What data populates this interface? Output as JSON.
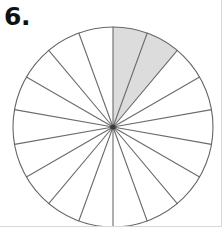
{
  "page": {
    "width": 222,
    "height": 227,
    "background_color": "#ffffff",
    "border_color": "#d8d8d8"
  },
  "problem": {
    "number_label": "6."
  },
  "figure": {
    "name": "fraction-circle-diagram",
    "center_x": 113,
    "center_y": 127,
    "radius": 100,
    "outline_color": "#666666",
    "spoke_color": "#6b6b6b",
    "shaded_fill_color": "#dcdcdc",
    "unshaded_fill_color": "#ffffff",
    "stroke_width": 1.1
  },
  "chart_data": {
    "type": "pie",
    "title": "6.",
    "xlabel": "",
    "ylabel": "",
    "total_sectors": 18,
    "sector_angle_degrees": 20,
    "shaded_sectors": 2,
    "unshaded_sectors": 16,
    "shaded_fraction": "2/18",
    "shaded_fraction_simplified": "1/9",
    "start_angle_degrees": 0,
    "shaded_sector_indices": [
      0,
      1
    ],
    "categories": [
      "shaded",
      "unshaded"
    ],
    "values": [
      2,
      16
    ],
    "colors": [
      "#dcdcdc",
      "#ffffff"
    ],
    "legend": false,
    "grid": false
  }
}
